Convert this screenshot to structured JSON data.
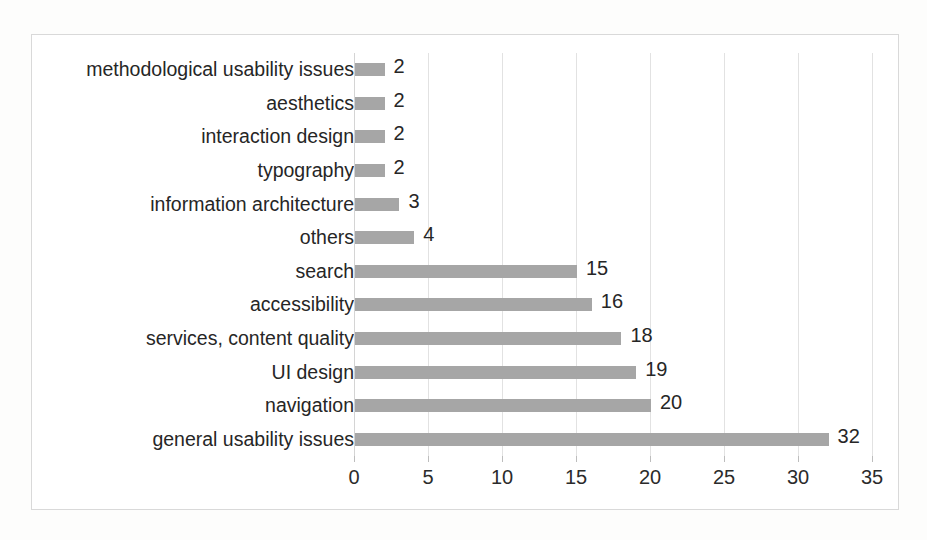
{
  "chart_data": {
    "type": "bar",
    "orientation": "horizontal",
    "title": "",
    "subtitle": "",
    "xlabel": "",
    "ylabel": "",
    "categories": [
      "methodological usability issues",
      "aesthetics",
      "interaction design",
      "typography",
      "information architecture",
      "others",
      "search",
      "accessibility",
      "services, content quality",
      "UI design",
      "navigation",
      "general usability issues"
    ],
    "values": [
      2,
      2,
      2,
      2,
      3,
      4,
      15,
      16,
      18,
      19,
      20,
      32
    ],
    "data_labels": [
      "2",
      "2",
      "2",
      "2",
      "3",
      "4",
      "15",
      "16",
      "18",
      "19",
      "20",
      "32"
    ],
    "xlim": [
      0,
      35
    ],
    "xticks": [
      0,
      5,
      10,
      15,
      20,
      25,
      30,
      35
    ],
    "xtick_labels": [
      "0",
      "5",
      "10",
      "15",
      "20",
      "25",
      "30",
      "35"
    ],
    "grid": true,
    "grid_axis": "x",
    "legend": false,
    "legend_position": "none",
    "bar_color": "#a6a6a6",
    "gridline_color": "#e2e2e2",
    "axis_color": "#d4d4d4",
    "text_color": "#262626",
    "plot_background": "#ffffff",
    "frame_border_color": "#d9d9d9",
    "page_background": "#fdfdfc"
  }
}
